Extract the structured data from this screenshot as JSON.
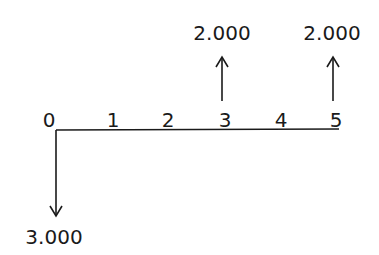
{
  "diagram": {
    "type": "cash-flow-timeline",
    "periods": [
      "0",
      "1",
      "2",
      "3",
      "4",
      "5"
    ],
    "cash_flows": [
      {
        "period": "0",
        "direction": "down",
        "amount": "3.000"
      },
      {
        "period": "3",
        "direction": "up",
        "amount": "2.000"
      },
      {
        "period": "5",
        "direction": "up",
        "amount": "2.000"
      }
    ]
  }
}
